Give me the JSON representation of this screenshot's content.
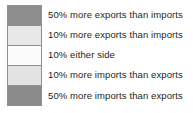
{
  "chart_data": {
    "type": "table",
    "title": "",
    "subtitle": "",
    "xlabel": "",
    "ylabel": "",
    "legend_position": "standalone",
    "grid": false,
    "categories": [
      "50% more exports than imports",
      "10% more exports than imports",
      "10% either side",
      "10% more imports than exports",
      "50% more imports than exports"
    ],
    "values": [
      50,
      10,
      0,
      -10,
      -50
    ],
    "colors": [
      "#8d8d8d",
      "#e8e8e8",
      "#fbfbfb",
      "#e3e3e3",
      "#8b8b8b"
    ],
    "series": [
      {
        "name": "Trade balance class",
        "values": [
          50,
          10,
          0,
          -10,
          -50
        ]
      }
    ]
  },
  "legend": {
    "border_color": "#8f8f8f",
    "text_color": "#231f20",
    "background": "#ffffff",
    "items": [
      {
        "label": "50% more exports than imports",
        "color": "#8d8d8d",
        "value": 50
      },
      {
        "label": "10% more exports than imports",
        "color": "#e8e8e8",
        "value": 10
      },
      {
        "label": "10% either side",
        "color": "#fbfbfb",
        "value": 0
      },
      {
        "label": "10% more imports than exports",
        "color": "#e3e3e3",
        "value": -10
      },
      {
        "label": "50% more imports than exports",
        "color": "#8b8b8b",
        "value": -50
      }
    ]
  }
}
